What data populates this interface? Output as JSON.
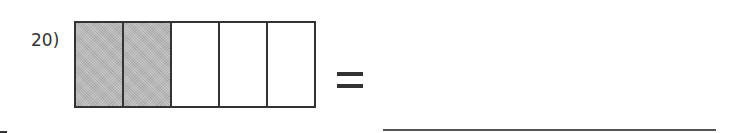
{
  "problem": {
    "number_label": "20)",
    "fraction_bar": {
      "total_parts": 5,
      "shaded_parts": 2,
      "cells": [
        {
          "shaded": true
        },
        {
          "shaded": true
        },
        {
          "shaded": false
        },
        {
          "shaded": false
        },
        {
          "shaded": false
        }
      ],
      "shade_color": "#bdbdbd",
      "border_color": "#333333"
    },
    "operator": "=",
    "answer": ""
  }
}
